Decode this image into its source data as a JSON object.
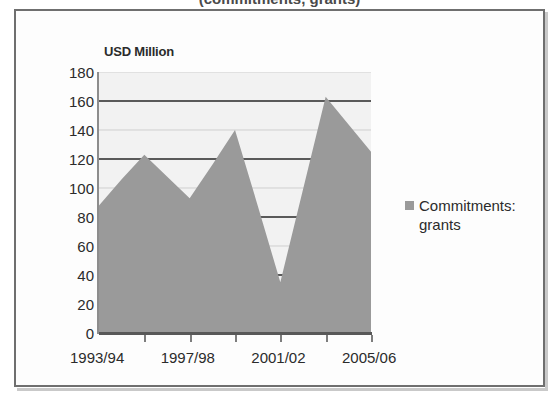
{
  "title_sliver": "(commitments, grants)",
  "chart_frame": {
    "axis_title": "USD Million"
  },
  "legend": {
    "entries": [
      {
        "label": "Commitments: grants",
        "color": "#9a9a9a",
        "marker": "square-marker"
      }
    ]
  },
  "colors": {
    "series_fill": "#9a9a9a",
    "plot_background": "#f2f2f2",
    "gridline_major": "#5a5a5a",
    "gridline_minor": "#cfcfcf",
    "axis": "#585858",
    "frame_border": "#6f6f6f",
    "text": "#2b2b2b"
  },
  "chart_data": {
    "type": "area",
    "title": "USD Million",
    "xlabel": "",
    "ylabel": "USD Million",
    "ylim": [
      0,
      180
    ],
    "ytick_step": 20,
    "ytick_labels": [
      "180",
      "160",
      "140",
      "120",
      "100",
      "80",
      "60",
      "40",
      "20",
      "0"
    ],
    "ytick_values": [
      180,
      160,
      140,
      120,
      100,
      80,
      60,
      40,
      20,
      0
    ],
    "grid": true,
    "legend_position": "right",
    "x": [
      "1993/94",
      "1994/95",
      "1995/96",
      "1996/97",
      "1997/98",
      "1998/99",
      "1999/00",
      "2000/01",
      "2001/02",
      "2002/03",
      "2003/04",
      "2004/05",
      "2005/06"
    ],
    "xtick_labels": [
      "1993/94",
      "1997/98",
      "2001/02",
      "2005/06"
    ],
    "xtick_label_indices": [
      0,
      4,
      8,
      12
    ],
    "series": [
      {
        "name": "Commitments: grants",
        "color": "#9a9a9a",
        "values": [
          88,
          106,
          123,
          108,
          93,
          116,
          140,
          88,
          35,
          99,
          163,
          144,
          125
        ]
      }
    ]
  }
}
